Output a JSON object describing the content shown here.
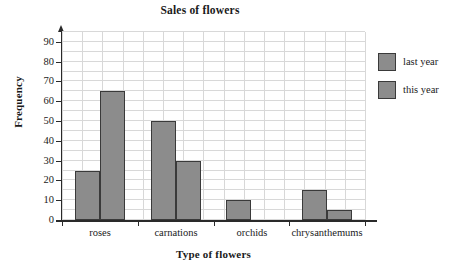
{
  "chart_data": {
    "type": "bar",
    "title": "Sales of flowers",
    "xlabel": "Type of flowers",
    "ylabel": "Frequency",
    "categories": [
      "roses",
      "carnations",
      "orchids",
      "chrysanthemums"
    ],
    "series": [
      {
        "name": "last year",
        "values": [
          25,
          50,
          10,
          15
        ]
      },
      {
        "name": "this year",
        "values": [
          65,
          30,
          0,
          5
        ]
      }
    ],
    "ylim": [
      0,
      95
    ],
    "yticks": [
      0,
      10,
      20,
      30,
      40,
      50,
      60,
      70,
      80,
      90
    ],
    "ytick_labels": [
      "0",
      "10",
      "20",
      "30",
      "40",
      "50",
      "60",
      "70",
      "80",
      "90"
    ],
    "grid": true,
    "legend_position": "right",
    "bar_color": "#8c8c8c",
    "bar_border_color": "#3a3a3a",
    "grid_color": "#d8d8d8",
    "axis_color": "#2a2a2a"
  }
}
